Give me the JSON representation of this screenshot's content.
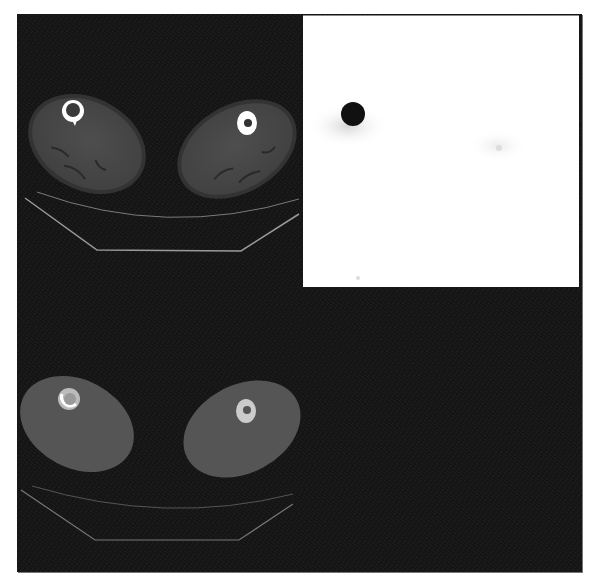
{
  "figure": {
    "panels": [
      {
        "id": "ct-top",
        "label": "CT axial thighs",
        "position": "top-left"
      },
      {
        "id": "pet",
        "label": "PET axial thighs",
        "position": "top-right"
      },
      {
        "id": "fused",
        "label": "Fused PET/CT axial thighs",
        "position": "bottom-left"
      }
    ],
    "colors": {
      "background": "#141414",
      "soft_tissue": "#4a4a4a",
      "bone": "#ffffff",
      "table_line": "#9a9a9a",
      "pet_background": "#ffffff",
      "pet_hotspot": "#111111"
    }
  },
  "caption": {
    "text": ""
  }
}
